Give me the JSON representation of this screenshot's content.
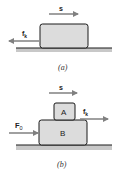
{
  "figure_a": {
    "caption": "(a)",
    "displacement_label": "s",
    "friction_label": "f",
    "friction_subscript": "k",
    "friction_direction": "left"
  },
  "figure_b": {
    "caption": "(b)",
    "displacement_label": "s",
    "block_top_label": "A",
    "block_bottom_label": "B",
    "friction_label": "f",
    "friction_subscript": "k",
    "friction_direction": "right",
    "applied_force_label": "F",
    "applied_force_subscript": "0"
  },
  "colors": {
    "block_fill": "#dcdcdc",
    "block_stroke": "#1a1a1a",
    "floor_fill": "#c8c8c8",
    "floor_line": "#1a1a1a",
    "arrow": "#808080"
  }
}
